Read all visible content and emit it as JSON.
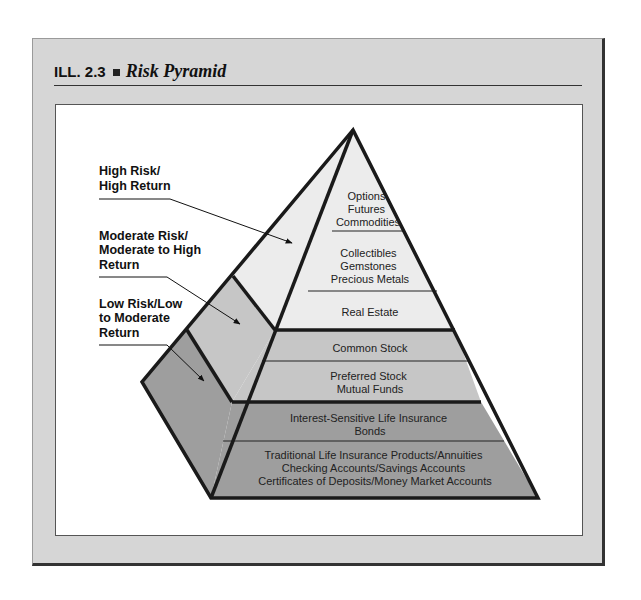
{
  "figure": {
    "label": "ILL. 2.3",
    "title": "Risk Pyramid"
  },
  "risk_labels": [
    {
      "lines": [
        "High Risk/",
        "High Return"
      ]
    },
    {
      "lines": [
        "Moderate Risk/",
        "Moderate to High",
        "Return"
      ]
    },
    {
      "lines": [
        "Low Risk/Low",
        "to Moderate",
        "Return"
      ]
    }
  ],
  "tiers": [
    {
      "group": "high",
      "lines": [
        "Options",
        "Futures",
        "Commodities"
      ]
    },
    {
      "group": "high",
      "lines": [
        "Collectibles",
        "Gemstones",
        "Precious Metals"
      ]
    },
    {
      "group": "high",
      "lines": [
        "Real Estate"
      ]
    },
    {
      "group": "moderate",
      "lines": [
        "Common Stock"
      ]
    },
    {
      "group": "moderate",
      "lines": [
        "Preferred Stock",
        "Mutual Funds"
      ]
    },
    {
      "group": "low",
      "lines": [
        "Interest-Sensitive Life Insurance",
        "Bonds"
      ]
    },
    {
      "group": "low",
      "lines": [
        "Traditional Life Insurance Products/Annuities",
        "Checking Accounts/Savings Accounts",
        "Certificates of Deposits/Money Market Accounts"
      ]
    }
  ],
  "colors": {
    "high": "#ececec",
    "moderate": "#c6c6c6",
    "low": "#9e9e9e",
    "outline": "#1a1a1a"
  }
}
